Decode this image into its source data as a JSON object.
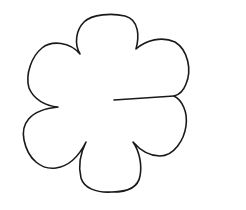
{
  "figure": {
    "subject": "six-petal flower outline",
    "petal_count": 6,
    "stroke_color": "#1a1a1a",
    "background_color": "#ffffff",
    "has_cut_line": true
  }
}
